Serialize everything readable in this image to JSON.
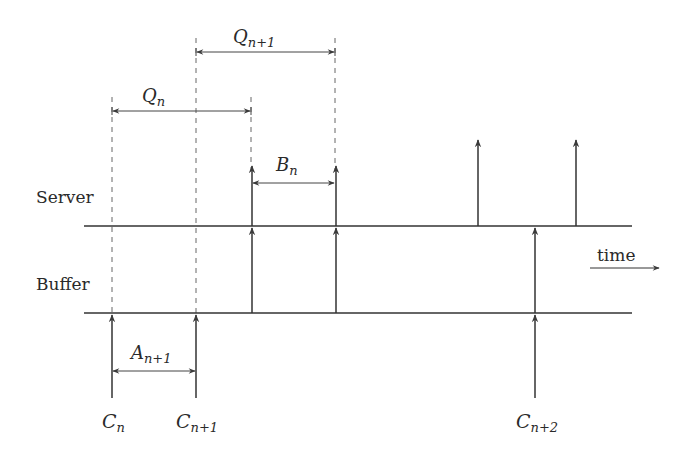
{
  "diagram": {
    "type": "timing-diagram",
    "rows": [
      {
        "id": "server",
        "label": "Server",
        "y": 226
      },
      {
        "id": "buffer",
        "label": "Buffer",
        "y": 313
      }
    ],
    "time_label": "time",
    "intervals": [
      {
        "id": "Qn",
        "base": "Q",
        "subscript": "n",
        "x1": 112,
        "x2": 251,
        "y": 111
      },
      {
        "id": "Qn1",
        "base": "Q",
        "subscript": "n+1",
        "x1": 196,
        "x2": 335,
        "y": 52
      },
      {
        "id": "Bn",
        "base": "B",
        "subscript": "n",
        "x1": 252,
        "x2": 335,
        "y": 183
      },
      {
        "id": "An1",
        "base": "A",
        "subscript": "n+1",
        "x1": 112,
        "x2": 196,
        "y": 371
      }
    ],
    "events": [
      {
        "id": "Cn",
        "base": "C",
        "subscript": "n",
        "x": 112
      },
      {
        "id": "Cn1",
        "base": "C",
        "subscript": "n+1",
        "x": 196
      },
      {
        "id": "Cn2",
        "base": "C",
        "subscript": "n+2",
        "x": 535
      }
    ],
    "labels": {
      "server": "Server",
      "buffer": "Buffer",
      "time": "time",
      "Qn": {
        "base": "Q",
        "sub": "n"
      },
      "Qn1": {
        "base": "Q",
        "sub": "n+1"
      },
      "Bn": {
        "base": "B",
        "sub": "n"
      },
      "An1": {
        "base": "A",
        "sub": "n+1"
      },
      "Cn": {
        "base": "C",
        "sub": "n"
      },
      "Cn1": {
        "base": "C",
        "sub": "n+1"
      },
      "Cn2": {
        "base": "C",
        "sub": "n+2"
      }
    },
    "colors": {
      "line": "#333333",
      "dashed": "#555555",
      "arrowhead": "#444444"
    }
  }
}
